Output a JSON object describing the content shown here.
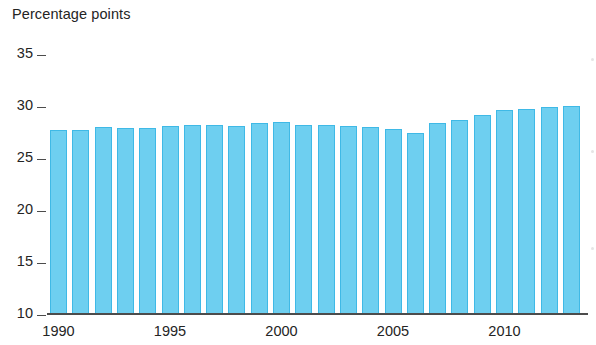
{
  "chart_data": {
    "type": "bar",
    "title": "Percentage points",
    "subtitle": "",
    "xlabel": "",
    "ylabel": "Percentage points",
    "ylim": [
      10,
      35
    ],
    "ytick_values": [
      10,
      15,
      20,
      25,
      30,
      35
    ],
    "ytick_labels": [
      "10",
      "15",
      "20",
      "25",
      "30",
      "35"
    ],
    "xtick_labels": [
      "1990",
      "1995",
      "2000",
      "2005",
      "2010"
    ],
    "xtick_categories": [
      "1990",
      "1995",
      "2000",
      "2005",
      "2010"
    ],
    "grid": false,
    "legend": false,
    "legend_position": "none",
    "bar_color": "#6ECFF0",
    "bar_border_color": "#3FB9E6",
    "axis_color": "#4C4C4C",
    "background_color": "#FFFFFF",
    "categories": [
      "1990",
      "1991",
      "1992",
      "1993",
      "1994",
      "1995",
      "1996",
      "1997",
      "1998",
      "1999",
      "2000",
      "2001",
      "2002",
      "2003",
      "2004",
      "2005",
      "2006",
      "2007",
      "2008",
      "2009",
      "2010",
      "2011",
      "2012",
      "2013"
    ],
    "values": [
      27.6,
      27.6,
      27.9,
      27.8,
      27.8,
      28.0,
      28.1,
      28.1,
      28.0,
      28.3,
      28.4,
      28.1,
      28.1,
      28.0,
      27.9,
      27.7,
      27.3,
      28.3,
      28.6,
      29.0,
      29.5,
      29.6,
      29.8,
      29.9
    ],
    "series": [
      {
        "name": "Percentage points",
        "values": [
          27.6,
          27.6,
          27.9,
          27.8,
          27.8,
          28.0,
          28.1,
          28.1,
          28.0,
          28.3,
          28.4,
          28.1,
          28.1,
          28.0,
          27.9,
          27.7,
          27.3,
          28.3,
          28.6,
          29.0,
          29.5,
          29.6,
          29.8,
          29.9
        ]
      }
    ]
  },
  "axis": {
    "y_title": "Percentage points"
  }
}
